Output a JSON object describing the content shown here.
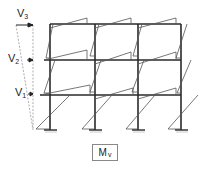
{
  "diagram": {
    "loads": [
      {
        "label": "V",
        "sub": "3",
        "y": 22
      },
      {
        "label": "V",
        "sub": "2",
        "y": 60
      },
      {
        "label": "V",
        "sub": "1",
        "y": 95
      }
    ],
    "columns_x": [
      50,
      95,
      138,
      181
    ],
    "beams_y": [
      24,
      60,
      95
    ],
    "base_y": 130,
    "moment_label": {
      "main": "M",
      "sub": "v"
    },
    "colors": {
      "frame": "#2a2a2a",
      "moment": "#555555",
      "dashed": "#888888",
      "support": "#999999"
    }
  }
}
